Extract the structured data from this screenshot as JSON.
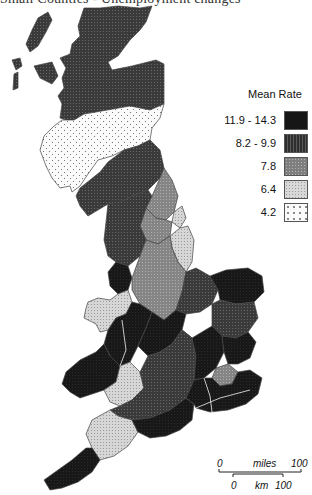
{
  "caption": "Small Counties - Unemployment changes",
  "legend": {
    "title": "Mean Rate",
    "classes": [
      {
        "label": "11.9 - 14.3",
        "color": "#161616",
        "pattern": "solid-dark"
      },
      {
        "label": "8.2 - 9.9",
        "color": "#3c3c3c",
        "pattern": "dense-hatch"
      },
      {
        "label": "7.8",
        "color": "#8a8a8a",
        "pattern": "medium-dots"
      },
      {
        "label": "6.4",
        "color": "#c4c4c4",
        "pattern": "light-dots"
      },
      {
        "label": "4.2",
        "color": "#f4f4f4",
        "pattern": "sparse-dots"
      }
    ]
  },
  "scale_bar": {
    "miles_label": "miles",
    "miles_start": "0",
    "miles_end": "100",
    "km_label": "km",
    "km_start": "0",
    "km_end": "100"
  },
  "map": {
    "subject": "Great Britain counties choropleth",
    "regions": [
      {
        "name": "Highlands & Islands",
        "class": "8.2 - 9.9"
      },
      {
        "name": "Central/Southern Scotland",
        "class": "4.2"
      },
      {
        "name": "Northern England (Cumbria/Northumberland)",
        "class": "8.2 - 9.9"
      },
      {
        "name": "North Yorkshire",
        "class": "7.8"
      },
      {
        "name": "Humberside coast",
        "class": "6.4"
      },
      {
        "name": "Lancashire/Yorkshire",
        "class": "8.2 - 9.9"
      },
      {
        "name": "Merseyside",
        "class": "11.9 - 14.3"
      },
      {
        "name": "Lincolnshire",
        "class": "6.4"
      },
      {
        "name": "East Midlands",
        "class": "7.8"
      },
      {
        "name": "Norfolk",
        "class": "11.9 - 14.3"
      },
      {
        "name": "North Wales",
        "class": "6.4"
      },
      {
        "name": "South/Mid Wales",
        "class": "11.9 - 14.3"
      },
      {
        "name": "West Midlands",
        "class": "11.9 - 14.3"
      },
      {
        "name": "South West England",
        "class": "8.2 - 9.9"
      },
      {
        "name": "Devon",
        "class": "6.4"
      },
      {
        "name": "Cornwall",
        "class": "11.9 - 14.3"
      },
      {
        "name": "Home Counties",
        "class": "11.9 - 14.3"
      },
      {
        "name": "London",
        "class": "7.8"
      },
      {
        "name": "Kent/Sussex",
        "class": "11.9 - 14.3"
      }
    ]
  }
}
